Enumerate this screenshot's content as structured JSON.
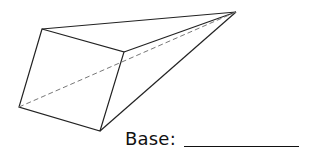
{
  "figure": {
    "type": "pyramid",
    "vertices": {
      "base_top_left": [
        42,
        29
      ],
      "base_top_right": [
        124,
        52
      ],
      "base_bottom_right": [
        100,
        131
      ],
      "base_bottom_left": [
        19,
        107
      ],
      "apex": [
        236,
        12
      ]
    },
    "stroke_color": "#222222",
    "hidden_edge_color": "#777777"
  },
  "question": {
    "label": "Base:",
    "answer": ""
  }
}
